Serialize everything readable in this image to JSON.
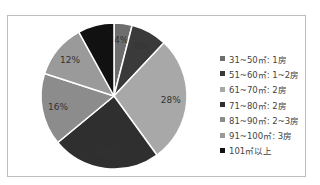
{
  "chart_data": {
    "type": "pie",
    "title": "",
    "categories": [
      "31~50㎡: 1房",
      "51~60㎡: 1~2房",
      "61~70㎡: 2房",
      "71~80㎡: 2房",
      "81~90㎡: 2~3房",
      "91~100㎡: 3房",
      "101㎡以上"
    ],
    "values": [
      4,
      8,
      28,
      24,
      16,
      12,
      8
    ],
    "value_labels": [
      "4%",
      "8%",
      "28%",
      "24%",
      "16%",
      "12%",
      ""
    ],
    "colors": [
      "#6e6e6e",
      "#3a3a3a",
      "#a8a8a8",
      "#2f2f2f",
      "#8c8c8c",
      "#9a9a9a",
      "#111111"
    ],
    "legend_position": "right"
  },
  "legend": {
    "items": [
      {
        "label": "31~50㎡: 1房",
        "color": "#6e6e6e"
      },
      {
        "label": "51~60㎡: 1~2房",
        "color": "#3a3a3a"
      },
      {
        "label": "61~70㎡: 2房",
        "color": "#a8a8a8"
      },
      {
        "label": "71~80㎡: 2房",
        "color": "#2f2f2f"
      },
      {
        "label": "81~90㎡: 2~3房",
        "color": "#8c8c8c"
      },
      {
        "label": "91~100㎡: 3房",
        "color": "#9a9a9a"
      },
      {
        "label": "101㎡以上",
        "color": "#111111"
      }
    ]
  }
}
